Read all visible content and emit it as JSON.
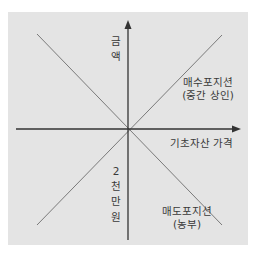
{
  "diagram": {
    "y_axis_label_top": [
      "금",
      "액"
    ],
    "y_axis_label_bottom": [
      "2",
      "천",
      "만",
      "원"
    ],
    "x_axis_label": "기초자산 가격",
    "long_position": {
      "line1": "매수포지션",
      "line2": "(중간 상인)"
    },
    "short_position": {
      "line1": "매도포지션",
      "line2": "(농부)"
    },
    "colors": {
      "background": "#e4e4e4",
      "axis": "#333333",
      "diagonal": "#707070",
      "text": "#3a3a3a"
    }
  }
}
